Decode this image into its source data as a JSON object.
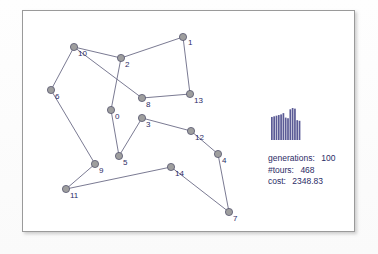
{
  "panel": {
    "title": "tsp-tour-view"
  },
  "graph": {
    "type": "tsp-tour",
    "node_radius": 3.6,
    "node_fill": "#9e9e9e",
    "node_stroke": "#55556e",
    "edge_color": "#6b6b86",
    "label_color": "#2b2b66",
    "nodes": [
      {
        "id": "0",
        "label": "0",
        "x": 88,
        "y": 99,
        "lx": 92,
        "ly": 108
      },
      {
        "id": "1",
        "label": "1",
        "x": 160,
        "y": 26,
        "lx": 165,
        "ly": 34
      },
      {
        "id": "2",
        "label": "2",
        "x": 98,
        "y": 47,
        "lx": 102,
        "ly": 56
      },
      {
        "id": "3",
        "label": "3",
        "x": 119,
        "y": 107,
        "lx": 123,
        "ly": 116
      },
      {
        "id": "4",
        "label": "4",
        "x": 195,
        "y": 143,
        "lx": 199,
        "ly": 152
      },
      {
        "id": "5",
        "label": "5",
        "x": 96,
        "y": 145,
        "lx": 100,
        "ly": 154
      },
      {
        "id": "6",
        "label": "6",
        "x": 28,
        "y": 79,
        "lx": 32,
        "ly": 88
      },
      {
        "id": "7",
        "label": "7",
        "x": 206,
        "y": 201,
        "lx": 210,
        "ly": 210
      },
      {
        "id": "8",
        "label": "8",
        "x": 119,
        "y": 87,
        "lx": 123,
        "ly": 96
      },
      {
        "id": "9",
        "label": "9",
        "x": 72,
        "y": 153,
        "lx": 76,
        "ly": 162
      },
      {
        "id": "10",
        "label": "10",
        "x": 51,
        "y": 36,
        "lx": 55,
        "ly": 45
      },
      {
        "id": "11",
        "label": "11",
        "x": 43,
        "y": 178,
        "lx": 47,
        "ly": 187
      },
      {
        "id": "12",
        "label": "12",
        "x": 168,
        "y": 120,
        "lx": 172,
        "ly": 129
      },
      {
        "id": "13",
        "label": "13",
        "x": 167,
        "y": 83,
        "lx": 171,
        "ly": 92
      },
      {
        "id": "14",
        "label": "14",
        "x": 148,
        "y": 156,
        "lx": 152,
        "ly": 165
      }
    ],
    "edges": [
      [
        "10",
        "2"
      ],
      [
        "2",
        "1"
      ],
      [
        "1",
        "13"
      ],
      [
        "13",
        "8"
      ],
      [
        "8",
        "10"
      ],
      [
        "2",
        "0"
      ],
      [
        "0",
        "5"
      ],
      [
        "5",
        "3"
      ],
      [
        "3",
        "12"
      ],
      [
        "12",
        "4"
      ],
      [
        "4",
        "7"
      ],
      [
        "7",
        "14"
      ],
      [
        "14",
        "11"
      ],
      [
        "11",
        "9"
      ],
      [
        "9",
        "6"
      ],
      [
        "6",
        "10"
      ]
    ]
  },
  "chart_data": {
    "type": "bar",
    "title": "",
    "xlabel": "",
    "ylabel": "",
    "categories": [
      "1",
      "2",
      "3",
      "4",
      "5",
      "6",
      "7",
      "8",
      "9",
      "10",
      "11",
      "12",
      "13"
    ],
    "values": [
      72,
      74,
      76,
      78,
      80,
      84,
      70,
      68,
      96,
      100,
      98,
      62,
      60
    ],
    "ylim": [
      0,
      100
    ],
    "grid": false,
    "legend_position": "none",
    "bar_color": "#5b5b96",
    "bar_gap_color": "#ffffff"
  },
  "stats": {
    "generations": {
      "key": "generations:",
      "value": "100"
    },
    "tours": {
      "key": "#tours:",
      "value": "468"
    },
    "cost": {
      "key": "cost:",
      "value": "2348.83"
    }
  }
}
